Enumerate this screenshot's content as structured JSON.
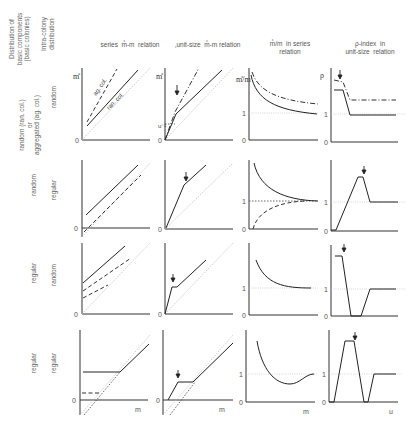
{
  "header": {
    "dist_basic": "Distribution of\nbasic components\n(basic colonies)",
    "dist_intra": "Intra-colony\ndistribution"
  },
  "columns": [
    {
      "label": "series  m̊-m  relation"
    },
    {
      "label": ",unit-size  m̊-m relation"
    },
    {
      "label": "m̊/m  in series\nrelation"
    },
    {
      "label": "ρ-index  in\nunit-size  relation"
    }
  ],
  "rows": [
    {
      "basic": "random (ran. col.)\nor\naggregated (ag. col.)",
      "intra": "random"
    },
    {
      "basic": "random",
      "intra": "regular"
    },
    {
      "basic": "regular",
      "intra": "random"
    },
    {
      "basic": "regular",
      "intra": "regular"
    }
  ],
  "axes": {
    "y_m_star": "m̊",
    "y_ratio": "m̊/m",
    "y_rho": "ρ",
    "x_m": "m",
    "x_u": "u",
    "zero": "0",
    "one": "1",
    "u_minus": "u⁻¹"
  },
  "curve_labels": {
    "ag_col": "ag. col.",
    "ran_col": "ran. col."
  },
  "arrow_glyph": "↓"
}
